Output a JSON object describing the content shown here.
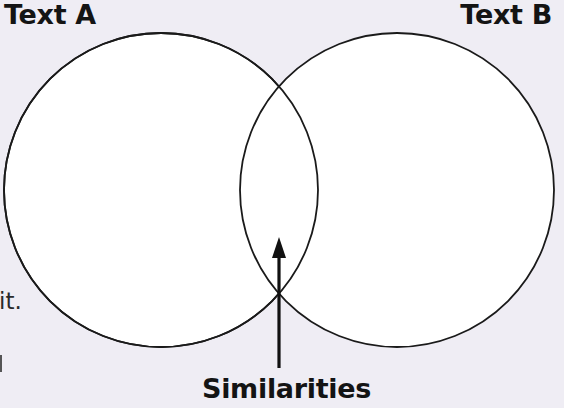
{
  "diagram": {
    "type": "venn",
    "background_color": "#efedf4",
    "stroke_color": "#1a1a1a",
    "fill_color": "#ffffff",
    "sets": [
      {
        "id": "A",
        "label": "Text A",
        "cx": 161,
        "cy": 190,
        "r": 158
      },
      {
        "id": "B",
        "label": "Text B",
        "cx": 397,
        "cy": 190,
        "r": 158
      }
    ],
    "intersection": {
      "label": "Similarities",
      "arrow": {
        "x": 279,
        "y_tip": 237,
        "y_tail": 368
      }
    }
  },
  "labels": {
    "text_a": "Text A",
    "text_b": "Text B",
    "similarities": "Similarities"
  },
  "cropped_fragments": {
    "left_margin_text": "it."
  }
}
